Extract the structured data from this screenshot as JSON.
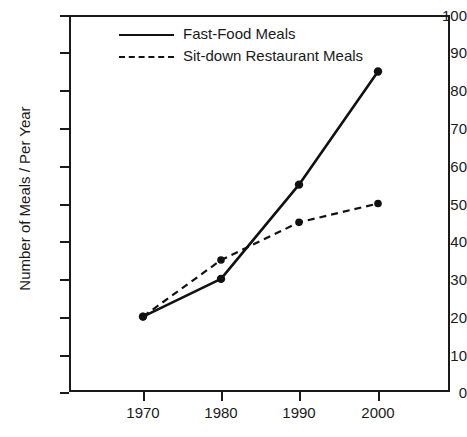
{
  "chart_data": {
    "type": "line",
    "title": "",
    "xlabel": "",
    "ylabel": "Number of Meals / Per Year",
    "categories": [
      "1970",
      "1980",
      "1990",
      "2000"
    ],
    "x": [
      1970,
      1980,
      1990,
      2000
    ],
    "xlim": [
      1965,
      2005
    ],
    "ylim": [
      0,
      100
    ],
    "ytick_values": [
      100,
      90,
      80,
      70,
      60,
      50,
      40,
      30,
      20,
      10,
      0
    ],
    "ytick_labels": [
      "100",
      "90",
      "80",
      "70",
      "60",
      "50",
      "40",
      "30",
      "20",
      "10",
      "0"
    ],
    "xtick_labels": [
      "1970",
      "1980",
      "1990",
      "2000"
    ],
    "grid": false,
    "legend_position": "top-left-inside",
    "series": [
      {
        "name": "Fast-Food Meals",
        "style": "solid",
        "color": "#111111",
        "marker": "circle",
        "values": [
          20,
          30,
          55,
          85
        ]
      },
      {
        "name": "Sit-down Restaurant Meals",
        "style": "dashed",
        "color": "#111111",
        "marker": "circle",
        "values": [
          20,
          35,
          45,
          50
        ]
      }
    ]
  },
  "legend": {
    "items": [
      {
        "label": "Fast-Food Meals",
        "swatch": "solid-line-swatch"
      },
      {
        "label": "Sit-down Restaurant Meals",
        "swatch": "dashed-line-swatch"
      }
    ]
  },
  "axes": {
    "y_title": "Number of Meals / Per Year",
    "y_labels": [
      "100",
      "90",
      "80",
      "70",
      "60",
      "50",
      "40",
      "30",
      "20",
      "10",
      "0"
    ],
    "x_labels": [
      "1970",
      "1980",
      "1990",
      "2000"
    ]
  },
  "colors": {
    "axis": "#1a1a1a",
    "series_1": "#111111",
    "series_2": "#111111",
    "background": "#ffffff"
  }
}
